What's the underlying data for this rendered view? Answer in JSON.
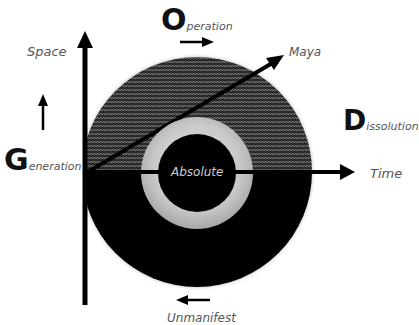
{
  "diagram": {
    "labels": {
      "space": "Space",
      "time": "Time",
      "maya": "Maya",
      "absolute": "Absolute",
      "unmanifest": "Unmanifest"
    },
    "phases": {
      "generation": {
        "initial": "G",
        "rest": "eneration"
      },
      "operation": {
        "initial": "O",
        "rest": "peration"
      },
      "dissolution": {
        "initial": "D",
        "rest": "issolution"
      }
    },
    "colors": {
      "outer_upper_pattern": "#3a3a3a",
      "outer_lower": "#000000",
      "ring": "#c8c8c8",
      "core": "#000000",
      "axes": "#000000",
      "label_text": "#555555",
      "absolute_text": "#cccccc"
    },
    "arrows": [
      {
        "name": "space-axis",
        "direction": "up"
      },
      {
        "name": "time-axis",
        "direction": "right"
      },
      {
        "name": "maya-arrow",
        "direction": "up-right"
      },
      {
        "name": "space-indicator",
        "direction": "up"
      },
      {
        "name": "operation-indicator",
        "direction": "right"
      },
      {
        "name": "unmanifest-indicator",
        "direction": "left"
      }
    ]
  }
}
